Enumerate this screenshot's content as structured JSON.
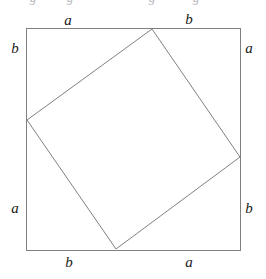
{
  "figure": {
    "width": 266,
    "height": 279,
    "background_color": "#ffffff",
    "stroke_color": "#808080",
    "text_color": "#1a1a1a",
    "stroke_width": 1
  },
  "outer_square": {
    "name": "outer-square",
    "left": 26,
    "top": 28,
    "right": 240,
    "bottom": 250,
    "width": 214,
    "height": 222
  },
  "inner_square": {
    "name": "inner-tilted-square",
    "points": "152,29 240,157 116,249 27,120",
    "vertices": [
      {
        "label": "top",
        "x": 152,
        "y": 29
      },
      {
        "label": "right",
        "x": 240,
        "y": 157
      },
      {
        "label": "bottom",
        "x": 116,
        "y": 249
      },
      {
        "label": "left",
        "x": 27,
        "y": 120
      }
    ]
  },
  "labels": [
    {
      "id": "top-left-a",
      "text": "a",
      "x": 68,
      "y": 20,
      "side": "top"
    },
    {
      "id": "top-right-b",
      "text": "b",
      "x": 189,
      "y": 19,
      "side": "top"
    },
    {
      "id": "left-top-b",
      "text": "b",
      "x": 15,
      "y": 48,
      "side": "left"
    },
    {
      "id": "left-bottom-a",
      "text": "a",
      "x": 15,
      "y": 208,
      "side": "left"
    },
    {
      "id": "right-top-a",
      "text": "a",
      "x": 249,
      "y": 48,
      "side": "right"
    },
    {
      "id": "right-bottom-b",
      "text": "b",
      "x": 249,
      "y": 208,
      "side": "right"
    },
    {
      "id": "bottom-left-b",
      "text": "b",
      "x": 69,
      "y": 262,
      "side": "bottom"
    },
    {
      "id": "bottom-right-a",
      "text": "a",
      "x": 189,
      "y": 262,
      "side": "bottom"
    }
  ],
  "clipped_top_glyphs": [
    {
      "id": "clipped-glyph-1",
      "text": "g",
      "x": 33
    },
    {
      "id": "clipped-glyph-2",
      "text": "g",
      "x": 70
    },
    {
      "id": "clipped-glyph-3",
      "text": "g",
      "x": 152
    },
    {
      "id": "clipped-glyph-4",
      "text": "g",
      "x": 196
    }
  ]
}
